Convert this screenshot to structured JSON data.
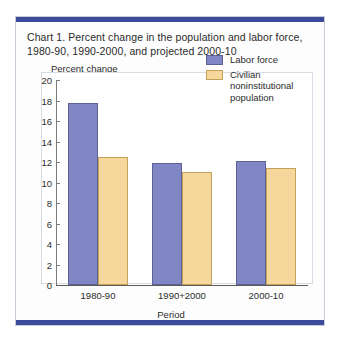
{
  "card": {
    "band_color": "#3b4a9c",
    "border_color": "#c8ccd8"
  },
  "chart_data": {
    "type": "bar",
    "title": "Chart 1. Percent change in the population and labor force, 1980-90, 1990-2000, and projected 2000-10",
    "xlabel": "Period",
    "ylabel": "Percent change",
    "categories": [
      "1980-90",
      "1990+2000",
      "2000-10"
    ],
    "series": [
      {
        "name": "Labor force",
        "color": "#8187c4",
        "border_color": "#5c6394",
        "values": [
          17.8,
          11.9,
          12.1
        ]
      },
      {
        "name": "Civilian noninstitutional population",
        "color": "#f6d89c",
        "border_color": "#c4a05a",
        "values": [
          12.5,
          11.0,
          11.4
        ]
      }
    ],
    "ylim": [
      0,
      20
    ],
    "yticks": [
      0,
      2,
      4,
      6,
      8,
      10,
      12,
      14,
      16,
      18,
      20
    ],
    "ytick_labels": [
      "0",
      "2",
      "4",
      "6",
      "8",
      "10",
      "12",
      "14",
      "16",
      "18",
      "20"
    ],
    "grid": false,
    "legend_position": "top-right"
  }
}
